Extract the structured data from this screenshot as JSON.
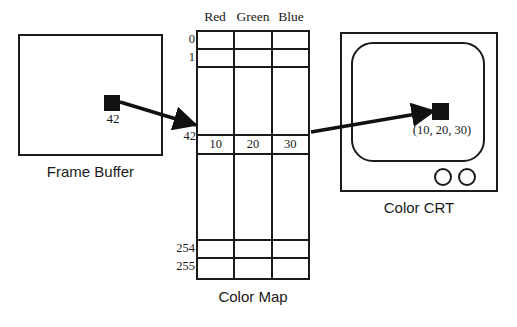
{
  "diagram": {
    "background_color": "#ffffff",
    "ink_color": "#1a1a1a"
  },
  "frame_buffer": {
    "caption": "Frame Buffer",
    "pixel_value": "42",
    "pixel_color": "#111111"
  },
  "color_map": {
    "caption": "Color Map",
    "columns": [
      "Red",
      "Green",
      "Blue"
    ],
    "selected_index": "42",
    "rows": [
      {
        "index": "0",
        "values": [
          "",
          "",
          ""
        ],
        "selected": false
      },
      {
        "index": "1",
        "values": [
          "",
          "",
          ""
        ],
        "selected": false
      },
      {
        "index": "",
        "values": [
          "",
          "",
          ""
        ],
        "selected": false
      },
      {
        "index": "42",
        "values": [
          "10",
          "20",
          "30"
        ],
        "selected": true
      },
      {
        "index": "",
        "values": [
          "",
          "",
          ""
        ],
        "selected": false
      },
      {
        "index": "254",
        "values": [
          "",
          "",
          ""
        ],
        "selected": false
      },
      {
        "index": "255",
        "values": [
          "",
          "",
          ""
        ],
        "selected": false
      }
    ]
  },
  "color_crt": {
    "caption": "Color CRT",
    "pixel_label": "(10, 20, 30)",
    "pixel_color": "#111111",
    "knob_count": 2
  },
  "arrows": [
    {
      "name": "frame-buffer-to-color-map",
      "from": "frame buffer pixel",
      "to": "color map row 42"
    },
    {
      "name": "color-map-to-crt",
      "from": "color map row 42",
      "to": "CRT pixel"
    }
  ]
}
